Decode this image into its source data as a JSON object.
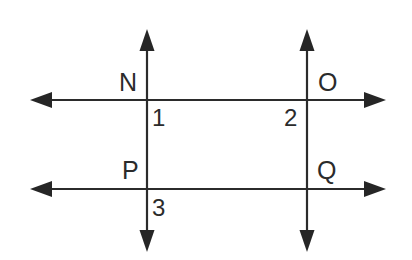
{
  "figure": {
    "type": "geometry-diagram",
    "background_color": "#ffffff",
    "stroke_color": "#2b2b2b",
    "stroke_width": 2
  },
  "lines": [
    {
      "id": "vertical-left",
      "orientation": "vertical",
      "x": 147,
      "y_start": 30,
      "y_end": 250,
      "arrow_start": true,
      "arrow_end": true
    },
    {
      "id": "vertical-right",
      "orientation": "vertical",
      "x": 307,
      "y_start": 30,
      "y_end": 250,
      "arrow_start": true,
      "arrow_end": true
    },
    {
      "id": "horizontal-top",
      "orientation": "horizontal",
      "y": 100,
      "x_start": 30,
      "x_end": 386,
      "arrow_start": true,
      "arrow_end": true
    },
    {
      "id": "horizontal-bottom",
      "orientation": "horizontal",
      "y": 189,
      "x_start": 30,
      "x_end": 386,
      "arrow_start": true,
      "arrow_end": true
    }
  ],
  "intersection_points": [
    {
      "id": "N",
      "label": "N",
      "x": 147,
      "y": 100
    },
    {
      "id": "O",
      "label": "O",
      "x": 307,
      "y": 100
    },
    {
      "id": "P",
      "label": "P",
      "x": 147,
      "y": 189
    },
    {
      "id": "Q",
      "label": "Q",
      "x": 307,
      "y": 189
    }
  ],
  "angle_labels": [
    {
      "id": "angle-1",
      "label": "1",
      "at_point": "N",
      "position": "below-right"
    },
    {
      "id": "angle-2",
      "label": "2",
      "at_point": "O",
      "position": "below-left"
    },
    {
      "id": "angle-3",
      "label": "3",
      "at_point": "P",
      "position": "below-right"
    }
  ],
  "labels": {
    "N": "N",
    "O": "O",
    "P": "P",
    "Q": "Q",
    "one": "1",
    "two": "2",
    "three": "3"
  }
}
